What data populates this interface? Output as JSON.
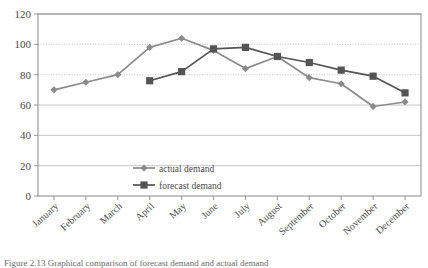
{
  "chart_data": {
    "type": "line",
    "title": "",
    "xlabel": "",
    "ylabel": "",
    "ylim": [
      0,
      120
    ],
    "yticks": [
      0,
      20,
      40,
      60,
      80,
      100,
      120
    ],
    "grid": true,
    "legend_position": "inside-center-lower",
    "categories": [
      "January",
      "February",
      "March",
      "April",
      "May",
      "June",
      "July",
      "August",
      "September",
      "October",
      "November",
      "December"
    ],
    "series": [
      {
        "name": "actual demand",
        "color": "#8c8c8c",
        "marker": "diamond",
        "values": [
          70,
          75,
          80,
          98,
          104,
          96,
          84,
          92,
          78,
          74,
          59,
          62
        ]
      },
      {
        "name": "forecast demand",
        "color": "#545454",
        "marker": "square",
        "values": [
          null,
          null,
          null,
          76,
          82,
          97,
          98,
          92,
          88,
          83,
          79,
          68
        ]
      }
    ]
  },
  "caption": {
    "text": "Figure 2.13  Graphical comparison of forecast demand and actual demand"
  },
  "colors": {
    "actual": "#8c8c8c",
    "forecast": "#545454",
    "grid": "#b8b8b8",
    "axis": "#8a8a8a"
  }
}
